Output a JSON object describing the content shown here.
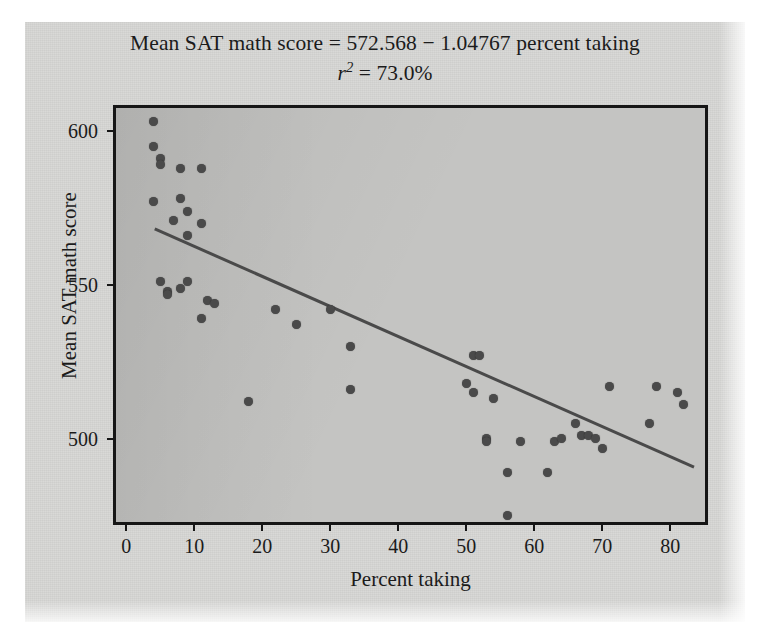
{
  "chart_data": {
    "type": "scatter",
    "title": "Mean SAT math score = 572.568 − 1.04767 percent taking",
    "title_line1": "Mean SAT math score = 572.568 − 1.04767 percent taking",
    "subtitle_prefix": "r",
    "subtitle_exponent": "2",
    "subtitle_value": " = 73.0%",
    "subtitle": "r2 = 73.0%",
    "xlabel": "Percent taking",
    "ylabel": "Mean SAT math score",
    "xlim": [
      -1.5,
      86.0
    ],
    "ylim": [
      471.0,
      607.5
    ],
    "xticks": [
      0,
      10,
      20,
      30,
      40,
      50,
      60,
      70,
      80
    ],
    "xticklabels": [
      "0",
      "10",
      "20",
      "30",
      "40",
      "50",
      "60",
      "70",
      "80"
    ],
    "yticks": [
      500,
      550,
      600
    ],
    "yticklabels": [
      "500",
      "550",
      "600"
    ],
    "grid": false,
    "legend": null,
    "marker_color": "#4a4a4a",
    "line_color": "#4a4a4a",
    "plot_background": "#c4c4c2",
    "figure_background": "#d6d6d4",
    "frame_color": "#161616",
    "regression": {
      "intercept": 572.568,
      "slope": -1.04767,
      "r_squared_percent": 73.0,
      "x_start": 4.2,
      "x_end": 83.5,
      "y_start": 568.2,
      "y_end": 490.8
    },
    "x": [
      4,
      4,
      5,
      5,
      8,
      11,
      4,
      8,
      9,
      7,
      11,
      9,
      5,
      6,
      6,
      9,
      8,
      12,
      13,
      11,
      18,
      22,
      25,
      30,
      33,
      33,
      51,
      52,
      50,
      51,
      54,
      53,
      53,
      56,
      58,
      56,
      62,
      63,
      64,
      66,
      67,
      68,
      69,
      70,
      71,
      77,
      78,
      81,
      82
    ],
    "y": [
      603,
      595,
      591,
      589,
      588,
      588,
      577,
      578,
      574,
      571,
      570,
      566,
      551,
      548,
      547,
      551,
      549,
      545,
      544,
      539,
      512,
      542,
      537,
      542,
      530,
      516,
      527,
      527,
      518,
      515,
      513,
      500,
      499,
      475,
      499,
      489,
      489,
      499,
      500,
      505,
      501,
      501,
      500,
      497,
      517,
      505,
      517,
      515,
      511
    ],
    "points": [
      {
        "x": 4,
        "y": 603
      },
      {
        "x": 4,
        "y": 595
      },
      {
        "x": 5,
        "y": 591
      },
      {
        "x": 5,
        "y": 589
      },
      {
        "x": 8,
        "y": 588
      },
      {
        "x": 11,
        "y": 588
      },
      {
        "x": 4,
        "y": 577
      },
      {
        "x": 8,
        "y": 578
      },
      {
        "x": 9,
        "y": 574
      },
      {
        "x": 7,
        "y": 571
      },
      {
        "x": 11,
        "y": 570
      },
      {
        "x": 9,
        "y": 566
      },
      {
        "x": 5,
        "y": 551
      },
      {
        "x": 6,
        "y": 548
      },
      {
        "x": 6,
        "y": 547
      },
      {
        "x": 9,
        "y": 551
      },
      {
        "x": 8,
        "y": 549
      },
      {
        "x": 12,
        "y": 545
      },
      {
        "x": 13,
        "y": 544
      },
      {
        "x": 11,
        "y": 539
      },
      {
        "x": 18,
        "y": 512
      },
      {
        "x": 22,
        "y": 542
      },
      {
        "x": 25,
        "y": 537
      },
      {
        "x": 30,
        "y": 542
      },
      {
        "x": 33,
        "y": 530
      },
      {
        "x": 33,
        "y": 516
      },
      {
        "x": 51,
        "y": 527
      },
      {
        "x": 52,
        "y": 527
      },
      {
        "x": 50,
        "y": 518
      },
      {
        "x": 51,
        "y": 515
      },
      {
        "x": 54,
        "y": 513
      },
      {
        "x": 53,
        "y": 500
      },
      {
        "x": 53,
        "y": 499
      },
      {
        "x": 56,
        "y": 475
      },
      {
        "x": 58,
        "y": 499
      },
      {
        "x": 56,
        "y": 489
      },
      {
        "x": 62,
        "y": 489
      },
      {
        "x": 63,
        "y": 499
      },
      {
        "x": 64,
        "y": 500
      },
      {
        "x": 66,
        "y": 505
      },
      {
        "x": 67,
        "y": 501
      },
      {
        "x": 68,
        "y": 501
      },
      {
        "x": 69,
        "y": 500
      },
      {
        "x": 70,
        "y": 497
      },
      {
        "x": 71,
        "y": 517
      },
      {
        "x": 77,
        "y": 505
      },
      {
        "x": 78,
        "y": 517
      },
      {
        "x": 81,
        "y": 515
      },
      {
        "x": 82,
        "y": 511
      }
    ]
  }
}
